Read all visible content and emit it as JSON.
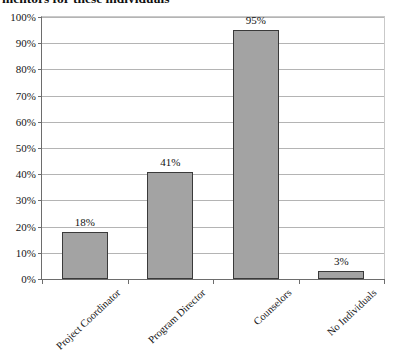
{
  "caption": {
    "text": "mentors for these individuals"
  },
  "chart_data": {
    "type": "bar",
    "title": "",
    "xlabel": "",
    "ylabel": "",
    "categories": [
      "Project Coordinator",
      "Program Director",
      "Counselors",
      "No Individuals"
    ],
    "values": [
      18,
      41,
      95,
      3
    ],
    "value_labels": [
      "18%",
      "41%",
      "95%",
      "3%"
    ],
    "ylim": [
      0,
      100
    ],
    "ytick_values": [
      0,
      10,
      20,
      30,
      40,
      50,
      60,
      70,
      80,
      90,
      100
    ],
    "ytick_labels": [
      "0%",
      "10%",
      "20%",
      "30%",
      "40%",
      "50%",
      "60%",
      "70%",
      "80%",
      "90%",
      "100%"
    ],
    "grid": true,
    "grid_axis": "y",
    "legend": false,
    "bar_color": "#a3a3a3",
    "bar_border_color": "#3a3a3a",
    "gridline_color": "#b4b4b4",
    "axis_color": "#6d6d6d"
  }
}
